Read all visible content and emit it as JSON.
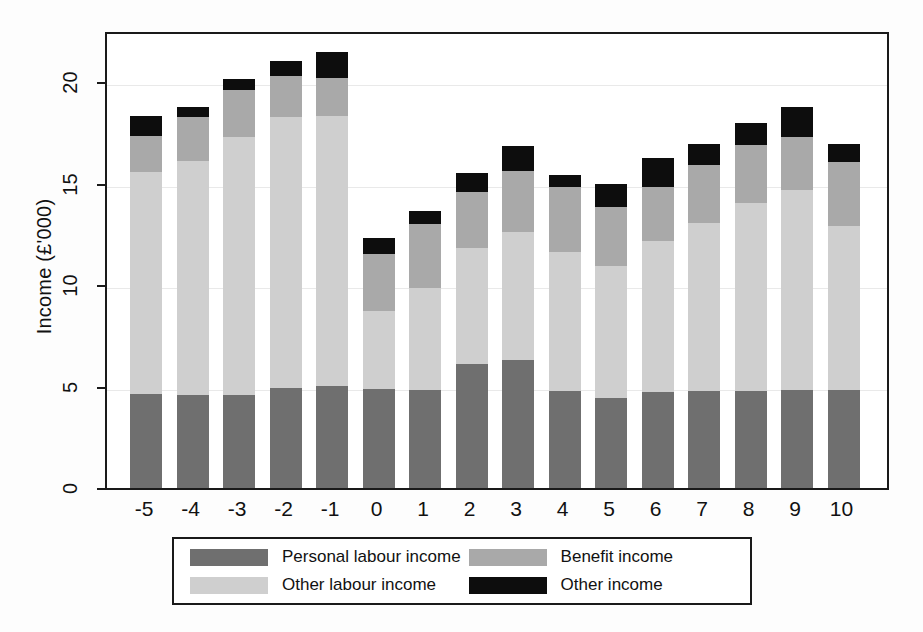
{
  "chart": {
    "type": "bar",
    "ylabel": "Income (£'000)",
    "xlabel": "",
    "title": "",
    "grid": true,
    "legend_position": "bottom"
  },
  "axis": {
    "y_ticks": [
      "0",
      "5",
      "10",
      "15",
      "20"
    ],
    "y_tick_values": [
      0,
      5,
      10,
      15,
      20
    ],
    "ylim": [
      0,
      22.3
    ],
    "x_ticks": [
      "-5",
      "-4",
      "-3",
      "-2",
      "-1",
      "0",
      "1",
      "2",
      "3",
      "4",
      "5",
      "6",
      "7",
      "8",
      "9",
      "10"
    ]
  },
  "legend": {
    "items": [
      {
        "label": "Personal labour income",
        "color": "#6f6f6f",
        "key": "personal_labour"
      },
      {
        "label": "Benefit income",
        "color": "#a9a9a9",
        "key": "benefit"
      },
      {
        "label": "Other labour income",
        "color": "#cfcfcf",
        "key": "other_labour"
      },
      {
        "label": "Other income",
        "color": "#0d0d0d",
        "key": "other"
      }
    ]
  },
  "colors": {
    "personal_labour": "#6f6f6f",
    "other_labour": "#cfcfcf",
    "benefit": "#a9a9a9",
    "other": "#0d0d0d",
    "frame": "#1a1a1a",
    "grid": "#e9e9e9",
    "background": "#ffffff"
  },
  "chart_data": {
    "type": "bar",
    "title": "",
    "xlabel": "",
    "ylabel": "Income (£'000)",
    "ylim": [
      0,
      22.3
    ],
    "grid": true,
    "legend_position": "bottom",
    "stacked": true,
    "categories": [
      "-5",
      "-4",
      "-3",
      "-2",
      "-1",
      "0",
      "1",
      "2",
      "3",
      "4",
      "5",
      "6",
      "7",
      "8",
      "9",
      "10"
    ],
    "series": [
      {
        "name": "Personal labour income",
        "color": "#6f6f6f",
        "values": [
          4.65,
          4.6,
          4.6,
          4.95,
          5.05,
          4.9,
          4.85,
          6.1,
          6.3,
          4.8,
          4.45,
          4.75,
          4.8,
          4.8,
          4.85,
          4.85
        ]
      },
      {
        "name": "Other labour income",
        "color": "#cfcfcf",
        "values": [
          10.9,
          11.5,
          12.7,
          13.35,
          13.3,
          3.8,
          5.0,
          5.7,
          6.3,
          6.85,
          6.5,
          7.4,
          8.25,
          9.25,
          9.85,
          8.05
        ]
      },
      {
        "name": "Benefit income",
        "color": "#a9a9a9",
        "values": [
          1.8,
          2.2,
          2.3,
          2.0,
          1.85,
          2.85,
          3.15,
          2.8,
          3.0,
          3.2,
          2.9,
          2.7,
          2.85,
          2.85,
          2.6,
          3.15
        ]
      },
      {
        "name": "Other income",
        "color": "#0d0d0d",
        "values": [
          1.0,
          0.45,
          0.55,
          0.75,
          1.3,
          0.75,
          0.65,
          0.9,
          1.25,
          0.55,
          1.15,
          1.4,
          1.05,
          1.1,
          1.45,
          0.9
        ]
      }
    ],
    "totals": [
      18.35,
      18.75,
      20.15,
      21.05,
      21.5,
      12.3,
      13.65,
      15.5,
      16.85,
      15.4,
      15.0,
      16.25,
      16.95,
      18.0,
      18.75,
      16.95
    ]
  }
}
